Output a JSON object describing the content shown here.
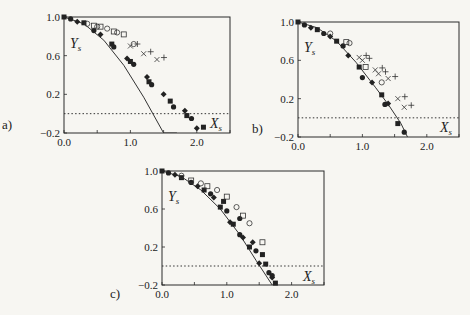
{
  "figure": {
    "panels": [
      {
        "id": "a",
        "label": "a)",
        "label_pos": [
          2,
          129
        ],
        "frame": {
          "left": 64,
          "right": 230,
          "top": 17,
          "bottom": 133
        },
        "ylabel_pos": [
          70,
          48
        ],
        "xlabel_pos": [
          210,
          128
        ]
      },
      {
        "id": "b",
        "label": "b)",
        "label_pos": [
          252,
          133
        ],
        "frame": {
          "left": 298,
          "right": 459,
          "top": 22,
          "bottom": 137
        },
        "ylabel_pos": [
          304,
          52
        ],
        "xlabel_pos": [
          440,
          132
        ]
      },
      {
        "id": "c",
        "label": "c)",
        "label_pos": [
          110,
          298
        ],
        "frame": {
          "left": 162,
          "right": 324,
          "top": 171,
          "bottom": 285
        },
        "ylabel_pos": [
          168,
          201
        ],
        "xlabel_pos": [
          303,
          281
        ]
      }
    ]
  },
  "chart_data": [
    {
      "type": "scatter",
      "title": "a)",
      "xlabel": "X_s",
      "ylabel": "Y_s",
      "xlim": [
        0.0,
        2.5
      ],
      "ylim": [
        -0.2,
        1.0
      ],
      "xticks": [
        "0.0",
        "1.0",
        "2.0"
      ],
      "yticks": [
        "1.0",
        "0.6",
        "0.2",
        "-0.2"
      ],
      "reference_line": {
        "y": 0,
        "style": "dotted"
      },
      "curve": {
        "name": "model",
        "x": [
          0.0,
          0.3,
          0.6,
          0.9,
          1.2,
          1.5,
          1.7
        ],
        "y": [
          1.0,
          0.93,
          0.76,
          0.5,
          0.17,
          -0.2,
          -0.2
        ]
      },
      "series": [
        {
          "name": "filled",
          "marker": "filled",
          "x": [
            0.0,
            0.1,
            0.2,
            0.3,
            0.45,
            0.55,
            0.72,
            0.75,
            0.95,
            1.0,
            1.05,
            1.25,
            1.28,
            1.32,
            1.5,
            1.6,
            1.65,
            1.82,
            1.85,
            1.92,
            2.0,
            2.1
          ],
          "y": [
            1.0,
            0.98,
            0.95,
            0.94,
            0.86,
            0.82,
            0.72,
            0.69,
            0.57,
            0.54,
            0.51,
            0.38,
            0.33,
            0.3,
            0.2,
            0.13,
            0.07,
            0.03,
            -0.02,
            -0.05,
            -0.15,
            -0.14
          ]
        },
        {
          "name": "open",
          "marker": "open",
          "x": [
            0.35,
            0.45,
            0.5,
            0.55,
            0.65,
            0.75,
            0.8,
            0.9,
            1.05
          ],
          "y": [
            0.93,
            0.91,
            0.9,
            0.9,
            0.88,
            0.85,
            0.84,
            0.82,
            0.72
          ]
        },
        {
          "name": "cross",
          "marker": "x+",
          "x": [
            1.0,
            1.2,
            1.4
          ],
          "y": [
            0.7,
            0.62,
            0.56
          ]
        }
      ]
    },
    {
      "type": "scatter",
      "title": "b)",
      "xlabel": "X_s",
      "ylabel": "Y_s",
      "xlim": [
        0.0,
        2.5
      ],
      "ylim": [
        -0.2,
        1.0
      ],
      "xticks": [
        "0.0",
        "1.0",
        "2.0"
      ],
      "yticks": [
        "1.0",
        "0.6",
        "0.2",
        "-0.2"
      ],
      "reference_line": {
        "y": 0,
        "style": "dotted"
      },
      "curve": {
        "name": "model",
        "x": [
          0.0,
          0.3,
          0.6,
          0.9,
          1.2,
          1.4,
          1.6,
          1.7
        ],
        "y": [
          1.0,
          0.94,
          0.8,
          0.58,
          0.32,
          0.14,
          -0.06,
          -0.2
        ]
      },
      "series": [
        {
          "name": "filled",
          "marker": "filled",
          "x": [
            0.0,
            0.1,
            0.2,
            0.3,
            0.4,
            0.5,
            0.6,
            0.7,
            0.78,
            0.95,
            1.0,
            1.15,
            1.3,
            1.35,
            1.4,
            1.55,
            1.65
          ],
          "y": [
            1.0,
            0.97,
            0.94,
            0.92,
            0.88,
            0.85,
            0.8,
            0.75,
            0.65,
            0.53,
            0.42,
            0.37,
            0.24,
            0.14,
            0.15,
            -0.06,
            -0.15
          ]
        },
        {
          "name": "open",
          "marker": "open",
          "x": [
            0.5,
            0.75,
            0.8,
            1.05,
            1.3
          ],
          "y": [
            0.88,
            0.79,
            0.78,
            0.53,
            0.37
          ]
        },
        {
          "name": "cross",
          "marker": "x+",
          "x": [
            0.95,
            1.0,
            1.2,
            1.25,
            1.4,
            1.55,
            1.65
          ],
          "y": [
            0.63,
            0.6,
            0.5,
            0.46,
            0.41,
            0.2,
            0.11
          ]
        }
      ]
    },
    {
      "type": "scatter",
      "title": "c)",
      "xlabel": "X_s",
      "ylabel": "Y_s",
      "xlim": [
        0.0,
        2.5
      ],
      "ylim": [
        -0.2,
        1.0
      ],
      "xticks": [
        "0.0",
        "1.0",
        "2.0"
      ],
      "yticks": [
        "1.0",
        "0.6",
        "0.2",
        "-0.2"
      ],
      "reference_line": {
        "y": 0,
        "style": "dotted"
      },
      "curve": {
        "name": "model",
        "x": [
          0.0,
          0.3,
          0.6,
          0.9,
          1.2,
          1.45,
          1.7
        ],
        "y": [
          1.0,
          0.94,
          0.8,
          0.6,
          0.33,
          0.06,
          -0.2
        ]
      },
      "series": [
        {
          "name": "filled",
          "marker": "filled",
          "x": [
            0.0,
            0.1,
            0.2,
            0.3,
            0.45,
            0.55,
            0.65,
            0.75,
            0.8,
            0.9,
            1.0,
            1.05,
            1.1,
            1.2,
            1.25,
            1.35,
            1.45,
            1.5,
            1.6,
            1.65,
            1.7,
            1.75
          ],
          "y": [
            1.0,
            0.98,
            0.96,
            0.93,
            0.88,
            0.84,
            0.8,
            0.76,
            0.72,
            0.62,
            0.58,
            0.46,
            0.44,
            0.33,
            0.3,
            0.2,
            0.16,
            0.03,
            0.02,
            -0.07,
            -0.12,
            -0.18
          ]
        },
        {
          "name": "filled-diamond",
          "marker": "filled",
          "x": [
            0.95,
            1.2,
            1.4,
            1.55,
            1.7
          ],
          "y": [
            0.68,
            0.5,
            0.25,
            0.12,
            -0.1
          ]
        },
        {
          "name": "open",
          "marker": "open",
          "x": [
            0.3,
            0.45,
            0.6,
            0.7,
            0.85,
            1.0,
            1.15,
            1.25,
            1.35,
            1.55
          ],
          "y": [
            0.95,
            0.9,
            0.87,
            0.84,
            0.8,
            0.73,
            0.62,
            0.53,
            0.45,
            0.25
          ]
        }
      ]
    }
  ]
}
